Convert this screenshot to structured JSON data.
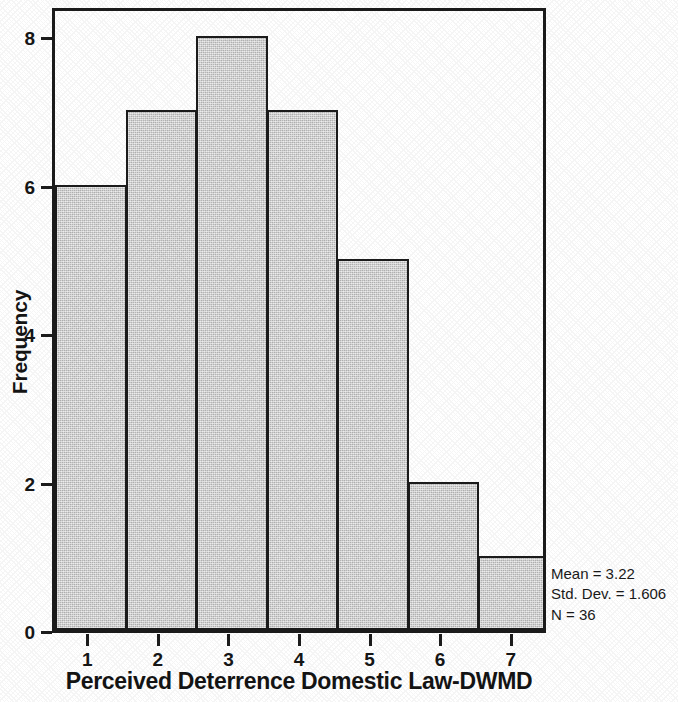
{
  "chart_data": {
    "type": "bar",
    "title": "",
    "xlabel": "Perceived Deterrence Domestic Law-DWMD",
    "ylabel": "Frequency",
    "categories": [
      "1",
      "2",
      "3",
      "4",
      "5",
      "6",
      "7"
    ],
    "values": [
      6,
      7,
      8,
      7,
      5,
      2,
      1
    ],
    "series": [
      {
        "name": "Frequency",
        "values": [
          6,
          7,
          8,
          7,
          5,
          2,
          1
        ]
      }
    ],
    "xtick_labels": [
      "1",
      "2",
      "3",
      "4",
      "5",
      "6",
      "7"
    ],
    "ytick_labels": [
      "0",
      "2",
      "4",
      "6",
      "8"
    ],
    "ytick_values": [
      0,
      2,
      4,
      6,
      8
    ],
    "ylim": [
      0,
      8.42
    ],
    "xlim": [
      0.5,
      7.5
    ],
    "grid": false,
    "legend": false,
    "bar_fill_color": "#cbcbcb",
    "bar_edge_color": "#1c1c1c",
    "frame_color": "#1c1c1c",
    "background_color": "#ffffff",
    "annotations": [
      "Mean = 3.22",
      "Std. Dev. = 1.606",
      "N = 36"
    ]
  },
  "stats": {
    "mean": "Mean = 3.22",
    "std_dev": "Std. Dev. = 1.606",
    "n": "N = 36"
  }
}
